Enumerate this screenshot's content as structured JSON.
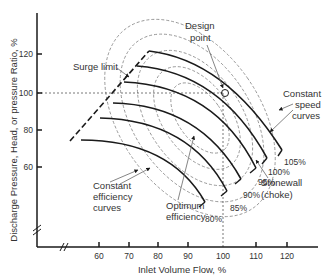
{
  "diagram": {
    "colors": {
      "line": "#1a1a1a",
      "dashed": "#555555",
      "efficiency": "#8a8a8a",
      "text": "#333333",
      "background": "#ffffff"
    },
    "y_axis": {
      "label": "Discharge Pressure, Head, or pressure Ratio, %",
      "ticks": [
        "120",
        "100",
        "80",
        "60"
      ],
      "break": true
    },
    "x_axis": {
      "label": "Inlet Volume Flow, %",
      "ticks": [
        "60",
        "70",
        "80",
        "90",
        "100",
        "110",
        "120"
      ],
      "break": true
    },
    "annotations": {
      "design_point": [
        "Design",
        "point"
      ],
      "surge_limit": "Surge limit",
      "constant_speed": [
        "Constant",
        "speed",
        "curves"
      ],
      "stonewall": [
        "Stonewall",
        "(choke)"
      ],
      "constant_efficiency": [
        "Constant",
        "efficiency",
        "curves"
      ],
      "optimum_efficiency": [
        "Optimum",
        "efficiency"
      ]
    },
    "speed_curves": [
      "105%",
      "100%",
      "95%",
      "90%",
      "85%",
      "80%"
    ]
  }
}
